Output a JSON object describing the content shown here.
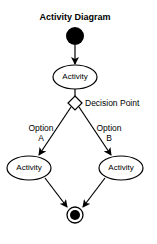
{
  "diagram": {
    "title": "Activity Diagram",
    "nodes": {
      "initial": {
        "type": "initial-node"
      },
      "activity_top": {
        "label": "Activity"
      },
      "decision": {
        "label": "Decision Point"
      },
      "activity_left": {
        "label": "Activity"
      },
      "activity_right": {
        "label": "Activity"
      },
      "final": {
        "type": "final-node"
      }
    },
    "edges": {
      "option_a": {
        "label_line1": "Option",
        "label_line2": "A"
      },
      "option_b": {
        "label_line1": "Option",
        "label_line2": "B"
      }
    },
    "colors": {
      "stroke": "#000000",
      "fill": "#ffffff",
      "background": "#ffffff"
    }
  }
}
